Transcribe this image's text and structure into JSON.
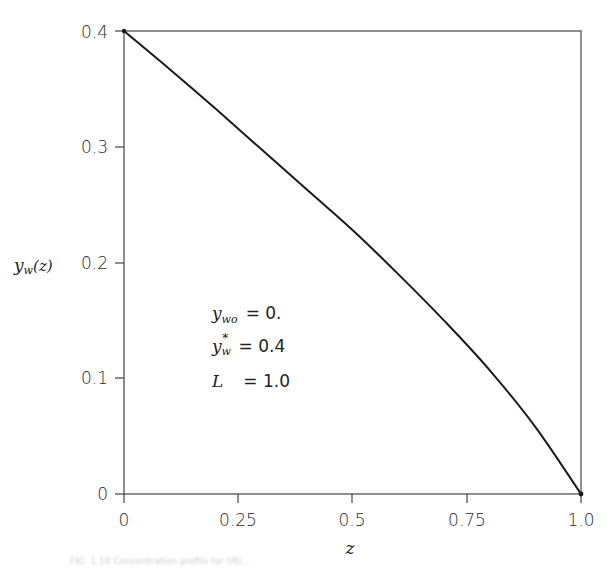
{
  "chart_data": {
    "type": "line",
    "title": "",
    "xlabel": "z",
    "ylabel": "y_w(z)",
    "xlim": [
      0,
      1.0
    ],
    "ylim": [
      0,
      0.4
    ],
    "grid": false,
    "legend": null,
    "x_ticks": [
      "0",
      "0.25",
      "0.5",
      "0.75",
      "1.0"
    ],
    "y_ticks": [
      "0",
      "0.1",
      "0.2",
      "0.3",
      "0.4"
    ],
    "series": [
      {
        "name": "y_w(z)",
        "x": [
          0.0,
          0.1,
          0.2,
          0.3,
          0.4,
          0.5,
          0.6,
          0.7,
          0.8,
          0.9,
          1.0
        ],
        "y": [
          0.4,
          0.367,
          0.333,
          0.298,
          0.263,
          0.228,
          0.19,
          0.15,
          0.107,
          0.058,
          0.0
        ]
      }
    ],
    "annotations": [
      {
        "label": "y_wo",
        "value": "= 0."
      },
      {
        "label": "y_w*",
        "value": "= 0.4"
      },
      {
        "label": "L",
        "value": "= 1.0"
      }
    ]
  },
  "labels": {
    "x_axis": "z",
    "y_axis_main": "y",
    "y_axis_sub": "w",
    "y_axis_arg": "(z)",
    "annot1_main": "y",
    "annot1_sub": "wo",
    "annot1_val": "= 0.",
    "annot2_main": "y",
    "annot2_sub": "w",
    "annot2_sup": "*",
    "annot2_val": "= 0.4",
    "annot3_main": "L",
    "annot3_val": "= 1.0"
  },
  "caption": "FIG. 1.10  Concentration profile for Ulti..."
}
